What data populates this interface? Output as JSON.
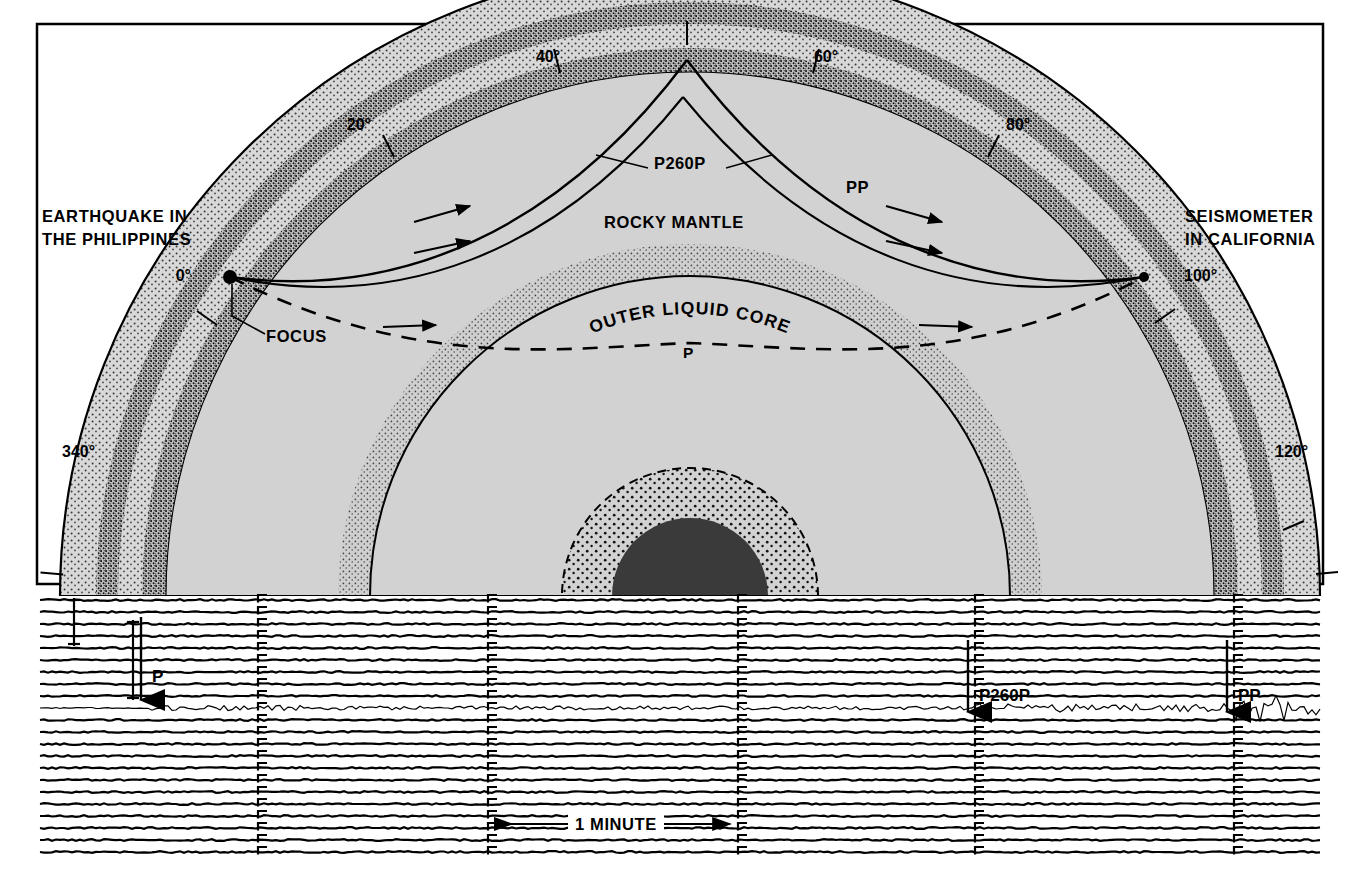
{
  "figure": {
    "kind": "seismic-ray-path-cross-section-with-seismogram",
    "panels": [
      {
        "name": "earth-cross-section",
        "frame": true
      },
      {
        "name": "seismogram-record",
        "frame": true
      }
    ]
  },
  "cross_section": {
    "source_label": {
      "line1": "EARTHQUAKE IN",
      "line2": "THE PHILIPPINES"
    },
    "receiver_label": {
      "line1": "SEISMOMETER",
      "line2": "IN CALIFORNIA"
    },
    "focus_label": "FOCUS",
    "layer_labels": {
      "mantle": "ROCKY MANTLE",
      "outer_core": "OUTER LIQUID CORE"
    },
    "ray_labels": {
      "p260p": "P260P",
      "pp": "PP",
      "p": "P"
    },
    "angle_ticks": [
      {
        "label": "340°",
        "degrees": -20,
        "side": "left"
      },
      {
        "label": "0°",
        "degrees": 0,
        "side": "left"
      },
      {
        "label": "20°",
        "degrees": 20,
        "side": "left"
      },
      {
        "label": "40°",
        "degrees": 40,
        "side": "left"
      },
      {
        "label": "60°",
        "degrees": 60,
        "side": "right"
      },
      {
        "label": "80°",
        "degrees": 80,
        "side": "right"
      },
      {
        "label": "100°",
        "degrees": 100,
        "side": "right"
      },
      {
        "label": "120°",
        "degrees": 120,
        "side": "right"
      }
    ],
    "colors": {
      "mantle_fill": "#d2d2d2",
      "crust_stipple": "#c8c8c8",
      "discontinuity_band": "#8c8c8c",
      "outer_core_fill": "#d2d2d2",
      "inner_core_fill": "#3a3a3a",
      "line": "#000000",
      "background": "#ffffff"
    }
  },
  "seismogram": {
    "scale_bar_label": "1 MINUTE",
    "arrival_markers": [
      {
        "label": "P",
        "phase": "P"
      },
      {
        "label": "P260P",
        "phase": "P260P"
      },
      {
        "label": "PP",
        "phase": "PP"
      }
    ],
    "trace_count": 22,
    "active_trace_index": 9,
    "colors": {
      "trace": "#000000",
      "background": "#ffffff"
    }
  }
}
